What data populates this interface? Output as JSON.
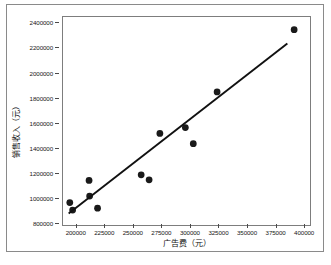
{
  "chart_data": {
    "type": "scatter",
    "title": "",
    "xlabel": "广告费（元）",
    "ylabel": "销售收入（元）",
    "xlim": [
      188000,
      406000
    ],
    "ylim": [
      780000,
      2450000
    ],
    "grid": false,
    "legend": "none",
    "xticks": [
      200000,
      225000,
      250000,
      275000,
      300000,
      325000,
      350000,
      375000,
      400000
    ],
    "xtick_labels": [
      "200000",
      "225000",
      "250000",
      "275000",
      "300000",
      "325000",
      "350000",
      "375000",
      "400000"
    ],
    "yticks": [
      800000,
      1000000,
      1200000,
      1400000,
      1600000,
      1800000,
      2000000,
      2200000,
      2400000
    ],
    "ytick_labels": [
      "800000",
      "1000000",
      "1200000",
      "1400000",
      "1600000",
      "1800000",
      "2000000",
      "2200000",
      "2400000"
    ],
    "series": [
      {
        "name": "观测值",
        "type": "scatter",
        "marker": "circle",
        "color": "#1a1a1a",
        "marker_size": 4.6,
        "points": [
          {
            "x": 194000,
            "y": 960000
          },
          {
            "x": 196500,
            "y": 900000
          },
          {
            "x": 211000,
            "y": 1138000
          },
          {
            "x": 211500,
            "y": 1012000
          },
          {
            "x": 218500,
            "y": 915000
          },
          {
            "x": 257000,
            "y": 1183000
          },
          {
            "x": 264000,
            "y": 1143000
          },
          {
            "x": 273500,
            "y": 1515000
          },
          {
            "x": 296000,
            "y": 1562000
          },
          {
            "x": 303000,
            "y": 1433000
          },
          {
            "x": 324000,
            "y": 1848000
          },
          {
            "x": 392000,
            "y": 2348000
          }
        ]
      },
      {
        "name": "趋势线",
        "type": "line",
        "color": "#111111",
        "line_width": 1.9,
        "points": [
          {
            "x": 193000,
            "y": 872000
          },
          {
            "x": 386000,
            "y": 2238000
          }
        ]
      }
    ]
  },
  "figure": {
    "background": "#ffffff",
    "frame_color": "#8a8a8a",
    "axes_color": "#7d7d7d",
    "tick_color": "#4a4a4a",
    "text_color": "#161616"
  }
}
